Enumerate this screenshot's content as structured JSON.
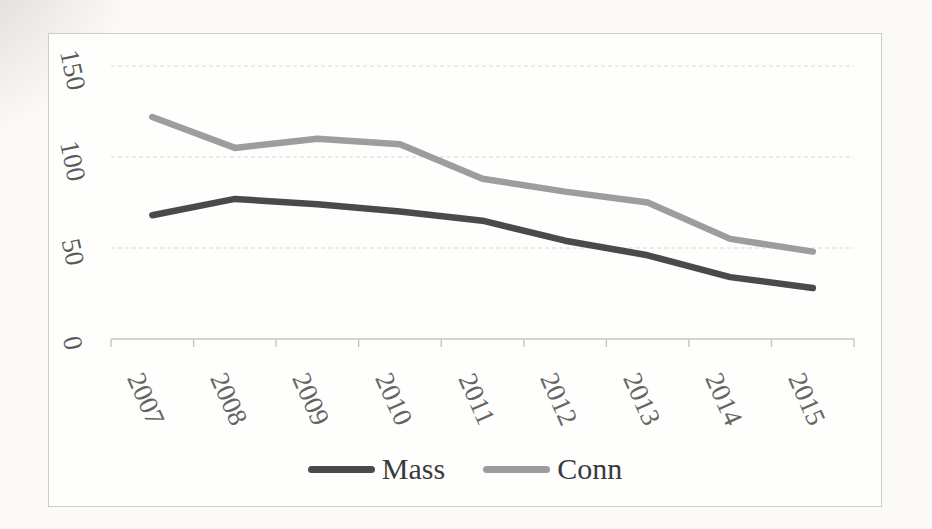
{
  "colors": {
    "page_background": "#fbfaf8",
    "frame_border": "#cfcdc9",
    "gridline": "#d9d7d3",
    "axis": "#c6c4c0",
    "mass_line": "#4a4a4a",
    "conn_line": "#9d9d9d"
  },
  "chart_data": {
    "type": "line",
    "title": "",
    "xlabel": "",
    "ylabel": "",
    "categories": [
      "2007",
      "2008",
      "2009",
      "2010",
      "2011",
      "2012",
      "2013",
      "2014",
      "2015"
    ],
    "series": [
      {
        "name": "Mass",
        "color": "#4a4a4a",
        "values": [
          68,
          77,
          74,
          70,
          65,
          54,
          46,
          34,
          28
        ]
      },
      {
        "name": "Conn",
        "color": "#9d9d9d",
        "values": [
          122,
          105,
          110,
          107,
          88,
          81,
          75,
          55,
          48
        ]
      }
    ],
    "y_ticks": [
      0,
      50,
      100,
      150
    ],
    "y_tick_labels": [
      "0",
      "50",
      "100",
      "150"
    ],
    "ylim": [
      0,
      167
    ],
    "grid": "horizontal-dotted",
    "legend_position": "bottom"
  }
}
